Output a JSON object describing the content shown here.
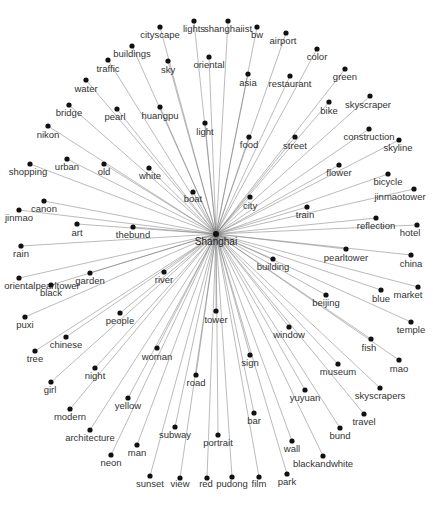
{
  "diagram": {
    "type": "radial-network-graph",
    "center": {
      "label": "Shanghai",
      "x": 216,
      "y": 234,
      "lx": 216,
      "ly": 245
    },
    "colors": {
      "node": "#111111",
      "edge": "#7a7a7a",
      "label": "#333333",
      "background": "#ffffff"
    },
    "nodes": [
      {
        "label": "cityscape",
        "x": 160,
        "y": 27,
        "lx": 160,
        "ly": 38
      },
      {
        "label": "lights",
        "x": 194,
        "y": 21,
        "lx": 194,
        "ly": 32
      },
      {
        "label": "shanghaiist",
        "x": 228,
        "y": 21,
        "lx": 228,
        "ly": 32
      },
      {
        "label": "bw",
        "x": 257,
        "y": 27,
        "lx": 257,
        "ly": 38
      },
      {
        "label": "airport",
        "x": 286,
        "y": 33,
        "lx": 283,
        "ly": 44
      },
      {
        "label": "buildings",
        "x": 132,
        "y": 46,
        "lx": 132,
        "ly": 57
      },
      {
        "label": "oriental",
        "x": 209,
        "y": 57,
        "lx": 209,
        "ly": 68
      },
      {
        "label": "color",
        "x": 317,
        "y": 49,
        "lx": 317,
        "ly": 60
      },
      {
        "label": "traffic",
        "x": 108,
        "y": 60,
        "lx": 108,
        "ly": 72
      },
      {
        "label": "sky",
        "x": 168,
        "y": 61,
        "lx": 168,
        "ly": 73
      },
      {
        "label": "asia",
        "x": 248,
        "y": 74,
        "lx": 248,
        "ly": 86
      },
      {
        "label": "restaurant",
        "x": 290,
        "y": 76,
        "lx": 290,
        "ly": 87
      },
      {
        "label": "green",
        "x": 345,
        "y": 69,
        "lx": 345,
        "ly": 80
      },
      {
        "label": "water",
        "x": 86,
        "y": 80,
        "lx": 86,
        "ly": 92
      },
      {
        "label": "bridge",
        "x": 69,
        "y": 105,
        "lx": 69,
        "ly": 116
      },
      {
        "label": "pearl",
        "x": 117,
        "y": 109,
        "lx": 115,
        "ly": 120
      },
      {
        "label": "huangpu",
        "x": 160,
        "y": 107,
        "lx": 160,
        "ly": 119
      },
      {
        "label": "bike",
        "x": 329,
        "y": 102,
        "lx": 329,
        "ly": 114
      },
      {
        "label": "skyscraper",
        "x": 370,
        "y": 96,
        "lx": 368,
        "ly": 108
      },
      {
        "label": "light",
        "x": 205,
        "y": 123,
        "lx": 205,
        "ly": 135
      },
      {
        "label": "nikon",
        "x": 48,
        "y": 126,
        "lx": 48,
        "ly": 138
      },
      {
        "label": "construction",
        "x": 369,
        "y": 129,
        "lx": 369,
        "ly": 140
      },
      {
        "label": "food",
        "x": 249,
        "y": 137,
        "lx": 249,
        "ly": 148
      },
      {
        "label": "street",
        "x": 295,
        "y": 137,
        "lx": 295,
        "ly": 149
      },
      {
        "label": "skyline",
        "x": 399,
        "y": 140,
        "lx": 398,
        "ly": 151
      },
      {
        "label": "shopping",
        "x": 30,
        "y": 164,
        "lx": 28,
        "ly": 175
      },
      {
        "label": "urban",
        "x": 67,
        "y": 159,
        "lx": 67,
        "ly": 170
      },
      {
        "label": "old",
        "x": 104,
        "y": 164,
        "lx": 104,
        "ly": 175
      },
      {
        "label": "white",
        "x": 149,
        "y": 168,
        "lx": 150,
        "ly": 179
      },
      {
        "label": "flower",
        "x": 339,
        "y": 165,
        "lx": 339,
        "ly": 176
      },
      {
        "label": "bicycle",
        "x": 388,
        "y": 174,
        "lx": 388,
        "ly": 185
      },
      {
        "label": "boat",
        "x": 193,
        "y": 192,
        "lx": 193,
        "ly": 202
      },
      {
        "label": "city",
        "x": 250,
        "y": 197,
        "lx": 250,
        "ly": 209
      },
      {
        "label": "jinmaotower",
        "x": 414,
        "y": 189,
        "lx": 400,
        "ly": 200
      },
      {
        "label": "train",
        "x": 307,
        "y": 207,
        "lx": 305,
        "ly": 218
      },
      {
        "label": "canon",
        "x": 44,
        "y": 201,
        "lx": 44,
        "ly": 212
      },
      {
        "label": "jinmao",
        "x": 19,
        "y": 210,
        "lx": 19,
        "ly": 221
      },
      {
        "label": "art",
        "x": 77,
        "y": 224,
        "lx": 77,
        "ly": 236
      },
      {
        "label": "thebund",
        "x": 133,
        "y": 227,
        "lx": 133,
        "ly": 238
      },
      {
        "label": "reflection",
        "x": 376,
        "y": 218,
        "lx": 376,
        "ly": 229
      },
      {
        "label": "hotel",
        "x": 417,
        "y": 225,
        "lx": 410,
        "ly": 236
      },
      {
        "label": "rain",
        "x": 21,
        "y": 246,
        "lx": 21,
        "ly": 257
      },
      {
        "label": "pearltower",
        "x": 346,
        "y": 249,
        "lx": 346,
        "ly": 261
      },
      {
        "label": "china",
        "x": 411,
        "y": 255,
        "lx": 411,
        "ly": 267
      },
      {
        "label": "orientalpearltower",
        "x": 19,
        "y": 278,
        "lx": 42,
        "ly": 289
      },
      {
        "label": "black",
        "x": 51,
        "y": 285,
        "lx": 51,
        "ly": 296
      },
      {
        "label": "garden",
        "x": 90,
        "y": 273,
        "lx": 90,
        "ly": 284
      },
      {
        "label": "river",
        "x": 164,
        "y": 272,
        "lx": 164,
        "ly": 283
      },
      {
        "label": "building",
        "x": 273,
        "y": 259,
        "lx": 273,
        "ly": 270
      },
      {
        "label": "beijing",
        "x": 326,
        "y": 295,
        "lx": 326,
        "ly": 306
      },
      {
        "label": "blue",
        "x": 381,
        "y": 290,
        "lx": 381,
        "ly": 302
      },
      {
        "label": "market",
        "x": 418,
        "y": 287,
        "lx": 408,
        "ly": 298
      },
      {
        "label": "puxi",
        "x": 25,
        "y": 317,
        "lx": 25,
        "ly": 328
      },
      {
        "label": "people",
        "x": 120,
        "y": 313,
        "lx": 120,
        "ly": 324
      },
      {
        "label": "tower",
        "x": 216,
        "y": 311,
        "lx": 216,
        "ly": 323
      },
      {
        "label": "window",
        "x": 289,
        "y": 327,
        "lx": 289,
        "ly": 338
      },
      {
        "label": "temple",
        "x": 411,
        "y": 322,
        "lx": 411,
        "ly": 333
      },
      {
        "label": "chinese",
        "x": 66,
        "y": 337,
        "lx": 66,
        "ly": 348
      },
      {
        "label": "tree",
        "x": 35,
        "y": 351,
        "lx": 35,
        "ly": 362
      },
      {
        "label": "fish",
        "x": 371,
        "y": 339,
        "lx": 369,
        "ly": 351
      },
      {
        "label": "woman",
        "x": 157,
        "y": 348,
        "lx": 157,
        "ly": 360
      },
      {
        "label": "sign",
        "x": 250,
        "y": 355,
        "lx": 250,
        "ly": 366
      },
      {
        "label": "mao",
        "x": 399,
        "y": 360,
        "lx": 399,
        "ly": 372
      },
      {
        "label": "night",
        "x": 95,
        "y": 368,
        "lx": 95,
        "ly": 379
      },
      {
        "label": "museum",
        "x": 338,
        "y": 364,
        "lx": 338,
        "ly": 375
      },
      {
        "label": "road",
        "x": 196,
        "y": 375,
        "lx": 196,
        "ly": 386
      },
      {
        "label": "girl",
        "x": 51,
        "y": 382,
        "lx": 50,
        "ly": 393
      },
      {
        "label": "yuyuan",
        "x": 305,
        "y": 390,
        "lx": 305,
        "ly": 401
      },
      {
        "label": "skyscrapers",
        "x": 380,
        "y": 388,
        "lx": 380,
        "ly": 399
      },
      {
        "label": "yellow",
        "x": 128,
        "y": 398,
        "lx": 128,
        "ly": 409
      },
      {
        "label": "modern",
        "x": 70,
        "y": 409,
        "lx": 70,
        "ly": 420
      },
      {
        "label": "bar",
        "x": 254,
        "y": 413,
        "lx": 254,
        "ly": 424
      },
      {
        "label": "travel",
        "x": 364,
        "y": 414,
        "lx": 364,
        "ly": 425
      },
      {
        "label": "architecture",
        "x": 90,
        "y": 430,
        "lx": 90,
        "ly": 441
      },
      {
        "label": "subway",
        "x": 175,
        "y": 427,
        "lx": 175,
        "ly": 438
      },
      {
        "label": "portrait",
        "x": 218,
        "y": 435,
        "lx": 218,
        "ly": 446
      },
      {
        "label": "bund",
        "x": 340,
        "y": 428,
        "lx": 340,
        "ly": 439
      },
      {
        "label": "man",
        "x": 137,
        "y": 445,
        "lx": 137,
        "ly": 456
      },
      {
        "label": "wall",
        "x": 292,
        "y": 441,
        "lx": 292,
        "ly": 452
      },
      {
        "label": "neon",
        "x": 111,
        "y": 455,
        "lx": 111,
        "ly": 466
      },
      {
        "label": "blackandwhite",
        "x": 323,
        "y": 456,
        "lx": 323,
        "ly": 467
      },
      {
        "label": "sunset",
        "x": 150,
        "y": 476,
        "lx": 150,
        "ly": 487
      },
      {
        "label": "view",
        "x": 180,
        "y": 478,
        "lx": 180,
        "ly": 487
      },
      {
        "label": "red",
        "x": 207,
        "y": 478,
        "lx": 206,
        "ly": 487
      },
      {
        "label": "pudong",
        "x": 232,
        "y": 477,
        "lx": 232,
        "ly": 487
      },
      {
        "label": "film",
        "x": 259,
        "y": 477,
        "lx": 259,
        "ly": 487
      },
      {
        "label": "park",
        "x": 287,
        "y": 474,
        "lx": 287,
        "ly": 485
      }
    ]
  }
}
